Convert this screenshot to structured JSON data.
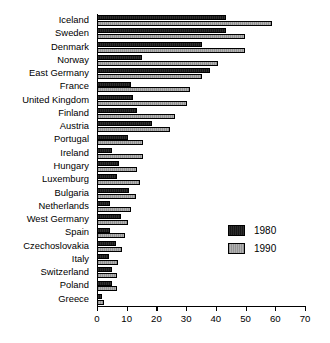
{
  "chart_data": {
    "type": "bar",
    "orientation": "horizontal",
    "title": "",
    "xlabel": "",
    "ylabel": "",
    "xlim": [
      0,
      70
    ],
    "xticks": [
      0,
      10,
      20,
      30,
      40,
      50,
      60,
      70
    ],
    "grid": false,
    "legend_position": "center-right",
    "categories": [
      "Iceland",
      "Sweden",
      "Denmark",
      "Norway",
      "East Germany",
      "France",
      "United Kingdom",
      "Finland",
      "Austria",
      "Portugal",
      "Ireland",
      "Hungary",
      "Luxemburg",
      "Bulgaria",
      "Netherlands",
      "West Germany",
      "Spain",
      "Czechoslovakia",
      "Italy",
      "Switzerland",
      "Poland",
      "Greece"
    ],
    "series": [
      {
        "name": "1980",
        "color": "#171717",
        "values": [
          43.5,
          43.5,
          35.5,
          15.0,
          38.0,
          11.5,
          12.0,
          13.5,
          18.5,
          10.5,
          5.0,
          7.5,
          6.8,
          10.8,
          4.5,
          8.0,
          4.5,
          6.5,
          4.0,
          5.0,
          5.0,
          1.7
        ]
      },
      {
        "name": "1990",
        "color": "#a9a9a9",
        "values": [
          58.8,
          49.8,
          49.8,
          40.8,
          35.4,
          31.3,
          30.3,
          26.3,
          24.5,
          15.5,
          15.5,
          13.5,
          14.5,
          13.0,
          11.5,
          10.5,
          9.5,
          8.5,
          7.0,
          6.7,
          6.7,
          2.3
        ]
      }
    ]
  },
  "legend": {
    "entries": [
      {
        "label": "1980",
        "swatch": "dark-swatch"
      },
      {
        "label": "1990",
        "swatch": "light-swatch"
      }
    ]
  }
}
